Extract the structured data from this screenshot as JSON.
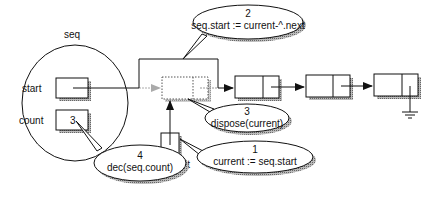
{
  "diagram": {
    "record": {
      "name": "seq",
      "fields": [
        {
          "label": "start",
          "value": ""
        },
        {
          "label": "count",
          "value": "3"
        }
      ]
    },
    "current_pointer": {
      "label": "current"
    },
    "list_nodes": 3,
    "callouts": [
      {
        "step": "1",
        "text": "current := seq.start"
      },
      {
        "step": "2",
        "text": "seq.start := current-^.next"
      },
      {
        "step": "3",
        "text": "dispose(current)"
      },
      {
        "step": "4",
        "text": "dec(seq.count)"
      }
    ],
    "colors": {
      "line": "#111111",
      "shadow": "#9a9a9a",
      "dotted": "#666666"
    }
  }
}
